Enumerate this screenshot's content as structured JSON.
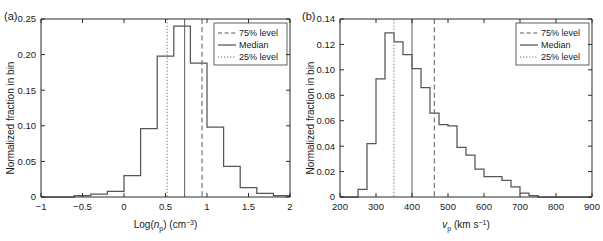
{
  "figure": {
    "background": "#ffffff",
    "line_color": "#555555",
    "axis_color": "#2b2b2b"
  },
  "legend": {
    "items": [
      {
        "label": "75% level",
        "style": "dashed"
      },
      {
        "label": "Median",
        "style": "solid"
      },
      {
        "label": "25% level",
        "style": "dotted"
      }
    ]
  },
  "panel_a": {
    "tag": "(a)",
    "ylabel": "Normalized fraction in bin",
    "xlabel_parts": {
      "prefix": "Log(",
      "var": "n",
      "var_sub": "p",
      "mid": ") (cm",
      "unit_sup": "−3",
      "suffix": ")"
    },
    "xticks": [
      "−1",
      "−0.5",
      "0",
      "0.5",
      "1",
      "1.5",
      "2"
    ],
    "yticks": [
      "0",
      "0.05",
      "0.10",
      "0.15",
      "0.20",
      "0.25"
    ]
  },
  "panel_b": {
    "tag": "(b)",
    "ylabel": "Normalized fraction in bin",
    "xlabel_parts": {
      "var": "v",
      "var_sub": "p",
      "mid": " (km s",
      "unit_sup": "−1",
      "suffix": ")"
    },
    "xticks": [
      "200",
      "300",
      "400",
      "500",
      "600",
      "700",
      "800",
      "900"
    ],
    "yticks": [
      "0",
      "0.02",
      "0.04",
      "0.06",
      "0.08",
      "0.10",
      "0.12",
      "0.14"
    ]
  },
  "chart_data": [
    {
      "type": "bar",
      "panel": "(a)",
      "title": "",
      "xlabel": "Log(n_p) (cm^-3)",
      "ylabel": "Normalized fraction in bin",
      "xlim": [
        -1,
        2
      ],
      "ylim": [
        0,
        0.25
      ],
      "xticks": [
        -1,
        -0.5,
        0,
        0.5,
        1,
        1.5,
        2
      ],
      "yticks": [
        0,
        0.05,
        0.1,
        0.15,
        0.2,
        0.25
      ],
      "grid": false,
      "legend_position": "upper-right",
      "bin_width": 0.2,
      "bin_edges": [
        -1.0,
        -0.8,
        -0.6,
        -0.4,
        -0.2,
        0.0,
        0.2,
        0.4,
        0.6,
        0.8,
        1.0,
        1.2,
        1.4,
        1.6,
        1.8,
        2.0
      ],
      "bin_centers": [
        -0.9,
        -0.7,
        -0.5,
        -0.3,
        -0.1,
        0.1,
        0.3,
        0.5,
        0.7,
        0.9,
        1.1,
        1.3,
        1.5,
        1.7,
        1.9
      ],
      "values": [
        0.0,
        0.0,
        0.002,
        0.004,
        0.008,
        0.03,
        0.096,
        0.198,
        0.24,
        0.188,
        0.098,
        0.043,
        0.013,
        0.005,
        0.002
      ],
      "annotations": [
        {
          "name": "25% level",
          "x": 0.52,
          "style": "dotted"
        },
        {
          "name": "Median",
          "x": 0.73,
          "style": "solid"
        },
        {
          "name": "75% level",
          "x": 0.94,
          "style": "dashed"
        }
      ]
    },
    {
      "type": "bar",
      "panel": "(b)",
      "title": "",
      "xlabel": "v_p (km s^-1)",
      "ylabel": "Normalized fraction in bin",
      "xlim": [
        200,
        900
      ],
      "ylim": [
        0,
        0.14
      ],
      "xticks": [
        200,
        300,
        400,
        500,
        600,
        700,
        800,
        900
      ],
      "yticks": [
        0,
        0.02,
        0.04,
        0.06,
        0.08,
        0.1,
        0.12,
        0.14
      ],
      "grid": false,
      "legend_position": "upper-right",
      "bin_width": 25,
      "bin_edges": [
        200,
        225,
        250,
        275,
        300,
        325,
        350,
        375,
        400,
        425,
        450,
        475,
        500,
        525,
        550,
        575,
        600,
        625,
        650,
        675,
        700,
        725,
        750,
        775,
        800,
        825,
        850,
        875,
        900
      ],
      "bin_centers": [
        212,
        237,
        262,
        287,
        312,
        337,
        362,
        387,
        412,
        437,
        462,
        487,
        512,
        537,
        562,
        587,
        612,
        637,
        662,
        687,
        712,
        737,
        762,
        787,
        812,
        837,
        862,
        887
      ],
      "values": [
        0.0,
        0.0,
        0.006,
        0.042,
        0.093,
        0.129,
        0.122,
        0.112,
        0.101,
        0.086,
        0.066,
        0.057,
        0.056,
        0.039,
        0.033,
        0.022,
        0.016,
        0.016,
        0.013,
        0.008,
        0.003,
        0.001,
        0.0,
        0.0,
        0.0,
        0.0,
        0.0,
        0.0
      ],
      "annotations": [
        {
          "name": "25% level",
          "x": 350,
          "style": "dotted"
        },
        {
          "name": "Median",
          "x": 400,
          "style": "solid"
        },
        {
          "name": "75% level",
          "x": 462,
          "style": "dashed"
        }
      ]
    }
  ]
}
